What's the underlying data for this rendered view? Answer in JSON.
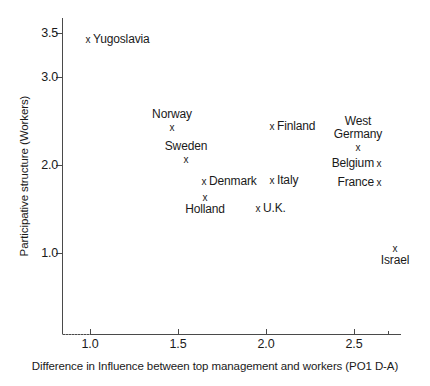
{
  "chart_data": {
    "type": "scatter",
    "title": "",
    "xlabel": "Difference in Influence between top management  and workers (PO1 D-A)",
    "ylabel": "Participative structure (Workers)",
    "xlim": [
      0.84,
      2.76
    ],
    "ylim": [
      0.32,
      3.6
    ],
    "xticks": [
      1.0,
      1.5,
      2.0,
      2.5
    ],
    "xticklabels": [
      "1.0",
      "1.5",
      "2.0",
      "2.5"
    ],
    "yticks": [
      1.0,
      2.0,
      3.0,
      3.5
    ],
    "yticklabels": [
      "1.0",
      "2.0",
      "3.0",
      "3.5"
    ],
    "grid": false,
    "legend": null,
    "marker": "x",
    "points": [
      {
        "label": "Yugoslavia",
        "x": 0.99,
        "y": 3.42,
        "label_pos": "right",
        "px": 88,
        "py": 40
      },
      {
        "label": "Norway",
        "x": 1.46,
        "y": 2.42,
        "label_pos": "above",
        "px": 172,
        "py": 128
      },
      {
        "label": "Finland",
        "x": 2.03,
        "y": 2.43,
        "label_pos": "right",
        "px": 272,
        "py": 127
      },
      {
        "label": "West\nGermany",
        "x": 2.52,
        "y": 2.19,
        "label_pos": "above2",
        "px": 358,
        "py": 148
      },
      {
        "label": "Sweden",
        "x": 1.54,
        "y": 2.06,
        "label_pos": "above",
        "px": 186,
        "py": 160
      },
      {
        "label": "Belgium",
        "x": 2.64,
        "y": 2.01,
        "label_pos": "left",
        "px": 379,
        "py": 164
      },
      {
        "label": "Denmark",
        "x": 1.65,
        "y": 1.81,
        "label_pos": "right",
        "px": 204,
        "py": 182
      },
      {
        "label": "Italy",
        "x": 2.03,
        "y": 1.82,
        "label_pos": "right",
        "px": 272,
        "py": 181
      },
      {
        "label": "France",
        "x": 2.64,
        "y": 1.8,
        "label_pos": "left",
        "px": 379,
        "py": 183
      },
      {
        "label": "Holland",
        "x": 1.65,
        "y": 1.63,
        "label_pos": "below",
        "px": 205,
        "py": 198
      },
      {
        "label": "U.K.",
        "x": 1.95,
        "y": 1.5,
        "label_pos": "right",
        "px": 258,
        "py": 209
      },
      {
        "label": "Israel",
        "x": 2.73,
        "y": 0.95,
        "label_pos": "below",
        "px": 395,
        "py": 249
      }
    ]
  },
  "axes": {
    "y_title": "Participative structure (Workers)",
    "x_title": "Difference in Influence between top management  and workers (PO1 D-A)",
    "y_tick_labels": [
      "3.5",
      "3.0",
      "2.0",
      "1.0"
    ],
    "y_tick_px": [
      33,
      77,
      165,
      253
    ],
    "x_tick_labels": [
      "1.0",
      "1.5",
      "2.0",
      "2.5"
    ],
    "x_tick_px": [
      90,
      178,
      266,
      354
    ],
    "x_minor_px": [
      388
    ]
  }
}
